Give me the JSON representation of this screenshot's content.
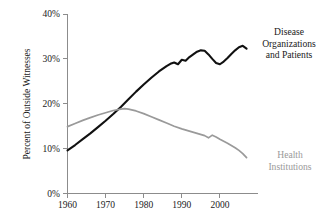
{
  "chart_data": {
    "type": "line",
    "title": "",
    "xlabel": "",
    "ylabel": "Percent of Outside Witnesses",
    "xlim": [
      1960,
      2010
    ],
    "ylim": [
      0,
      40
    ],
    "grid": false,
    "legend_position": "inline-right",
    "x_ticks": [
      1960,
      1970,
      1980,
      1990,
      2000
    ],
    "x_tick_labels": [
      "1960",
      "1970",
      "1980",
      "1990",
      "2000"
    ],
    "y_ticks": [
      0,
      10,
      20,
      30,
      40
    ],
    "y_tick_labels": [
      "0%",
      "10%",
      "20%",
      "30%",
      "40%"
    ],
    "series": [
      {
        "name": "Disease Organizations and Patients",
        "label_lines": [
          "Disease",
          "Organizations",
          "and Patients"
        ],
        "color": "#111111",
        "x": [
          1960,
          1962,
          1964,
          1966,
          1968,
          1970,
          1972,
          1974,
          1976,
          1978,
          1980,
          1982,
          1984,
          1986,
          1987,
          1988,
          1989,
          1990,
          1991,
          1992,
          1993,
          1994,
          1995,
          1996,
          1997,
          1998,
          1999,
          2000,
          2001,
          2002,
          2003,
          2004,
          2005,
          2006,
          2007
        ],
        "values": [
          9.6,
          10.8,
          12.1,
          13.4,
          14.8,
          16.2,
          17.7,
          19.3,
          21.0,
          22.7,
          24.3,
          25.8,
          27.2,
          28.4,
          28.9,
          29.2,
          28.8,
          29.8,
          29.6,
          30.4,
          31.0,
          31.6,
          31.9,
          31.8,
          31.0,
          30.0,
          29.1,
          28.8,
          29.4,
          30.2,
          31.1,
          31.9,
          32.6,
          32.9,
          32.3
        ]
      },
      {
        "name": "Health Institutions",
        "label_lines": [
          "Health",
          "Institutions"
        ],
        "color": "#9a9a9a",
        "x": [
          1960,
          1962,
          1964,
          1966,
          1968,
          1970,
          1972,
          1974,
          1975,
          1976,
          1978,
          1980,
          1982,
          1984,
          1986,
          1988,
          1990,
          1992,
          1994,
          1996,
          1997,
          1998,
          1999,
          2000,
          2002,
          2004,
          2005,
          2006,
          2007
        ],
        "values": [
          14.9,
          15.6,
          16.3,
          16.9,
          17.5,
          18.0,
          18.5,
          18.8,
          18.9,
          18.8,
          18.4,
          17.8,
          17.1,
          16.4,
          15.7,
          15.0,
          14.4,
          13.9,
          13.4,
          12.9,
          12.4,
          13.0,
          12.6,
          12.1,
          11.2,
          10.2,
          9.6,
          8.9,
          8.0
        ]
      }
    ],
    "annotations": [
      {
        "name": "disease-organizations-label",
        "series": 0,
        "x_px": 289,
        "y_px": 35
      },
      {
        "name": "health-institutions-label",
        "series": 1,
        "x_px": 290,
        "y_px": 158
      }
    ]
  }
}
